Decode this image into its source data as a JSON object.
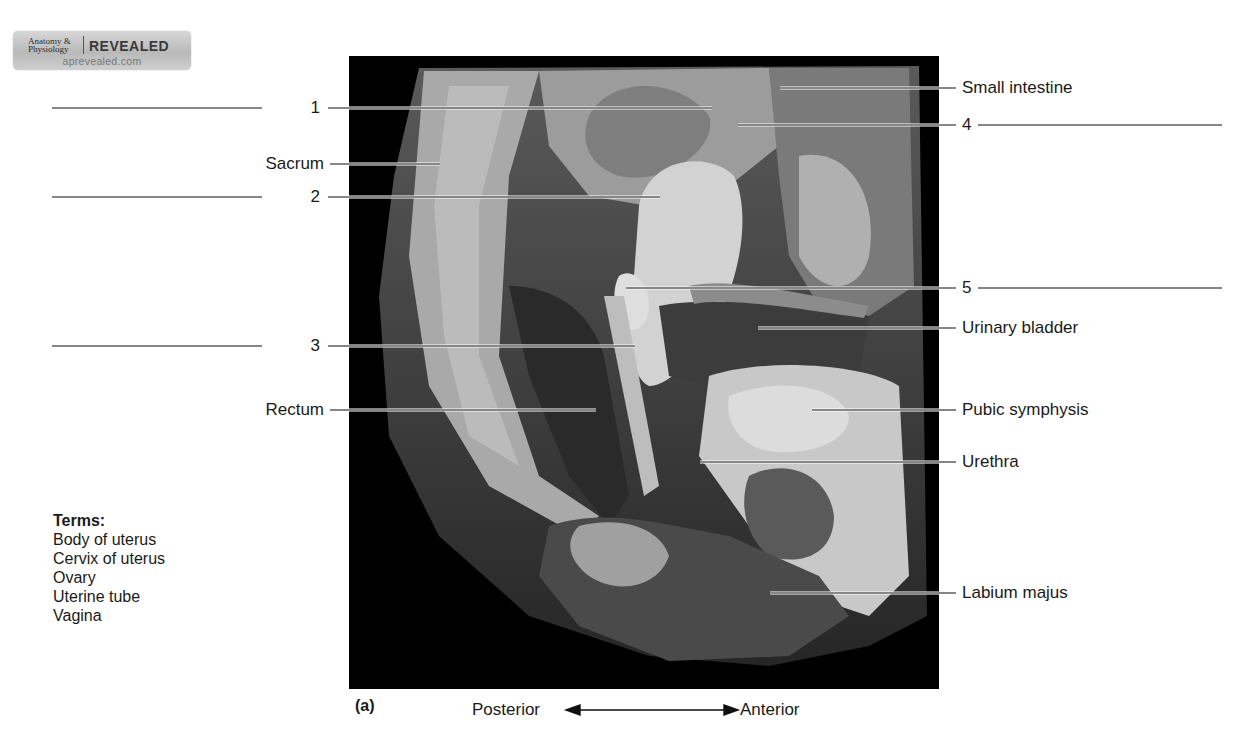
{
  "logo": {
    "line1": "Anatomy &",
    "line2": "Physiology",
    "brand": "REVEALED",
    "url": "aprevealed.com"
  },
  "figure": {
    "panel": "(a)",
    "orientation": {
      "left": "Posterior",
      "right": "Anterior"
    },
    "colors": {
      "background": "#ffffff",
      "photo_frame": "#000000",
      "text": "#1a1a1a",
      "leader": "#111111"
    }
  },
  "left_labels": [
    {
      "id": "1",
      "text": "1",
      "blank": true
    },
    {
      "id": "sacrum",
      "text": "Sacrum",
      "blank": false
    },
    {
      "id": "2",
      "text": "2",
      "blank": true
    },
    {
      "id": "3",
      "text": "3",
      "blank": true
    },
    {
      "id": "rectum",
      "text": "Rectum",
      "blank": false
    }
  ],
  "right_labels": [
    {
      "id": "small-intestine",
      "text": "Small intestine",
      "blank": false
    },
    {
      "id": "4",
      "text": "4",
      "blank": true
    },
    {
      "id": "5",
      "text": "5",
      "blank": true
    },
    {
      "id": "urinary-bladder",
      "text": "Urinary bladder",
      "blank": false
    },
    {
      "id": "pubic-symphysis",
      "text": "Pubic symphysis",
      "blank": false
    },
    {
      "id": "urethra",
      "text": "Urethra",
      "blank": false
    },
    {
      "id": "labium-majus",
      "text": "Labium majus",
      "blank": false
    }
  ],
  "terms": {
    "title": "Terms:",
    "items": [
      "Body of uterus",
      "Cervix of uterus",
      "Ovary",
      "Uterine tube",
      "Vagina"
    ]
  }
}
